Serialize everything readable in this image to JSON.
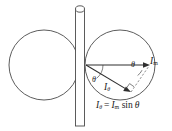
{
  "figure": {
    "type": "physics-vector-diagram",
    "background_color": "#ffffff",
    "stroke_color": "#3f3f3f",
    "text_color": "#1a1a1a",
    "width": 172,
    "height": 131
  },
  "shapes": {
    "left_circle": {
      "name": "left-circle",
      "cx": 44,
      "cy": 65,
      "r": 35
    },
    "right_circle": {
      "name": "right-circle",
      "cx": 120,
      "cy": 65,
      "r": 35
    },
    "rod": {
      "name": "vertical-rod",
      "x": 75,
      "y_top": 6,
      "y_bottom": 126,
      "width": 9
    }
  },
  "vectors": {
    "horizontal": {
      "name": "I-m-vector",
      "from_x": 86,
      "from_y": 65,
      "to_x": 150,
      "to_y": 65
    },
    "angled": {
      "name": "I-theta-vector",
      "from_x": 86,
      "from_y": 65,
      "to_x": 131,
      "to_y": 92
    },
    "projection_dashed": {
      "name": "projection-dashed-line",
      "from_x": 131,
      "from_y": 92,
      "to_x": 150,
      "to_y": 65
    }
  },
  "labels": {
    "i_max": {
      "symbol": "I",
      "subscript": "m"
    },
    "i_theta": {
      "symbol": "I",
      "subscript": "θ"
    },
    "theta_vertex": "θ",
    "theta_right": "θ",
    "equation": {
      "lhs_symbol": "I",
      "lhs_subscript": "θ",
      "equals": "=",
      "rhs_symbol": "I",
      "rhs_subscript": "m",
      "function": "sin",
      "argument": "θ",
      "plain_text": "Iθ = Im sin θ"
    }
  },
  "markers": {
    "angle_arc_vertex": {
      "name": "angle-arc-vertex",
      "radius": 17
    },
    "angle_arc_right": {
      "name": "angle-arc-right",
      "radius": 13
    },
    "right_angle": {
      "name": "right-angle-marker",
      "size": 6
    }
  }
}
